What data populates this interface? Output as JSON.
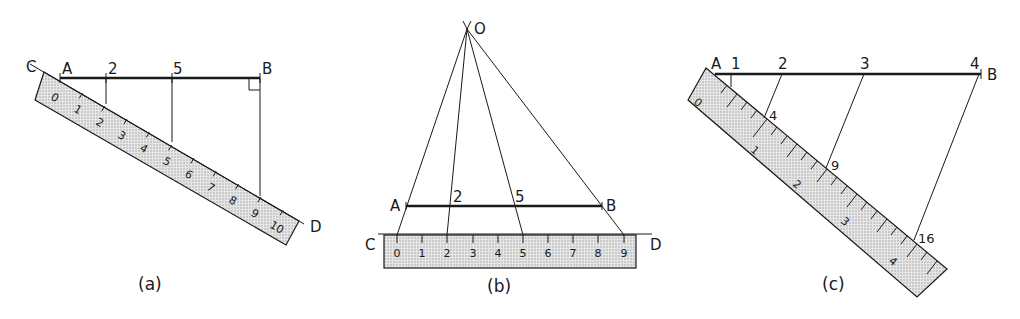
{
  "figure": {
    "panels": [
      {
        "id": "a",
        "caption": "(a)",
        "line_points": {
          "A": "A",
          "B": "B",
          "C": "C",
          "D": "D"
        },
        "division_labels": [
          "2",
          "5"
        ],
        "scale_labels": [
          "0",
          "1",
          "2",
          "3",
          "4",
          "5",
          "6",
          "7",
          "8",
          "9",
          "10"
        ]
      },
      {
        "id": "b",
        "caption": "(b)",
        "line_points": {
          "O": "O",
          "A": "A",
          "B": "B",
          "C": "C",
          "D": "D"
        },
        "division_labels": [
          "2",
          "5"
        ],
        "scale_labels": [
          "0",
          "1",
          "2",
          "3",
          "4",
          "5",
          "6",
          "7",
          "8",
          "9"
        ]
      },
      {
        "id": "c",
        "caption": "(c)",
        "line_points": {
          "A": "A",
          "B": "B"
        },
        "division_labels": [
          "1",
          "2",
          "3",
          "4"
        ],
        "scale_marks": [
          "4",
          "9",
          "16"
        ],
        "scale_labels": [
          "0",
          "1",
          "2",
          "3",
          "4"
        ]
      }
    ]
  }
}
